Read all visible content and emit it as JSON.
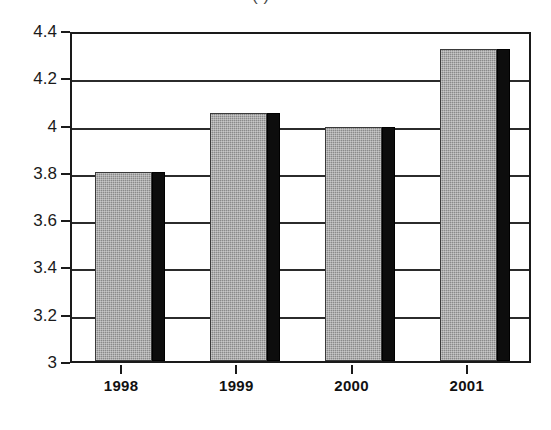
{
  "chart_data": {
    "type": "bar",
    "title": "",
    "title_remnant": "(   )",
    "xlabel": "",
    "ylabel": "",
    "categories": [
      "1998",
      "1999",
      "2000",
      "2001"
    ],
    "values": [
      3.8,
      4.05,
      3.99,
      4.32
    ],
    "series": [
      {
        "name": "",
        "values": [
          3.8,
          4.05,
          3.99,
          4.32
        ]
      }
    ],
    "ylim": [
      3,
      4.4
    ],
    "ytick_values": [
      3,
      3.2,
      3.4,
      3.6,
      3.8,
      4,
      4.2,
      4.4
    ],
    "ytick_labels": [
      "3",
      "3.2",
      "3.4",
      "3.6",
      "3.8",
      "4",
      "4.2",
      "4.4"
    ],
    "grid": true,
    "grid_axis": "y",
    "legend": false,
    "legend_position": "none",
    "bar_style": "3d-shadow",
    "colors": {
      "bar_face": "#8a8a8a",
      "bar_shadow": "#0d0d0d",
      "axis": "#1a1a1a",
      "gridline": "#2b2b2b",
      "background": "#ffffff",
      "text": "#111111"
    }
  }
}
